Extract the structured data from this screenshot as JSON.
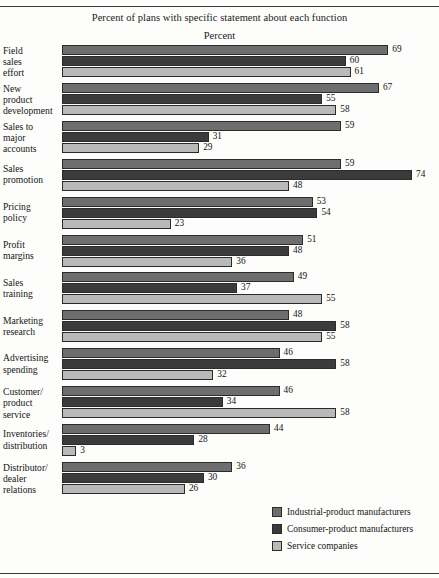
{
  "chart_data": {
    "type": "bar",
    "orientation": "horizontal",
    "title": "Percent of plans with specific statement about each function",
    "subtitle": "Percent",
    "xlabel": "Percent",
    "ylabel": "",
    "xlim": [
      0,
      74
    ],
    "grid": false,
    "legend_position": "bottom-right",
    "categories": [
      "Field sales effort",
      "New product development",
      "Sales to major accounts",
      "Sales promotion",
      "Pricing policy",
      "Profit margins",
      "Sales training",
      "Marketing research",
      "Advertising spending",
      "Customer/ product service",
      "Inventories/ distribution",
      "Distributor/ dealer relations"
    ],
    "category_lines": [
      [
        "Field",
        "sales",
        "effort"
      ],
      [
        "New",
        "product",
        "development"
      ],
      [
        "Sales to",
        "major",
        "accounts"
      ],
      [
        "Sales",
        "promotion"
      ],
      [
        "Pricing",
        "policy"
      ],
      [
        "Profit",
        "margins"
      ],
      [
        "Sales",
        "training"
      ],
      [
        "Marketing",
        "research"
      ],
      [
        "Advertising",
        "spending"
      ],
      [
        "Customer/",
        "product",
        "service"
      ],
      [
        "Inventories/",
        "distribution"
      ],
      [
        "Distributor/",
        "dealer",
        "relations"
      ]
    ],
    "series": [
      {
        "name": "Industrial-product manufacturers",
        "color": "#6e6e6e",
        "values": [
          69,
          67,
          59,
          59,
          53,
          51,
          49,
          48,
          46,
          46,
          44,
          36
        ]
      },
      {
        "name": "Consumer-product manufacturers",
        "color": "#3b3b3b",
        "values": [
          60,
          55,
          31,
          74,
          54,
          48,
          37,
          58,
          58,
          34,
          28,
          30
        ]
      },
      {
        "name": "Service companies",
        "color": "#b9b9b9",
        "values": [
          61,
          58,
          29,
          48,
          23,
          36,
          55,
          55,
          32,
          58,
          3,
          26
        ]
      }
    ]
  },
  "legend": {
    "items": [
      {
        "label": "Industrial-product manufacturers",
        "color": "#6e6e6e"
      },
      {
        "label": "Consumer-product manufacturers",
        "color": "#3b3b3b"
      },
      {
        "label": "Service companies",
        "color": "#b9b9b9"
      }
    ]
  }
}
